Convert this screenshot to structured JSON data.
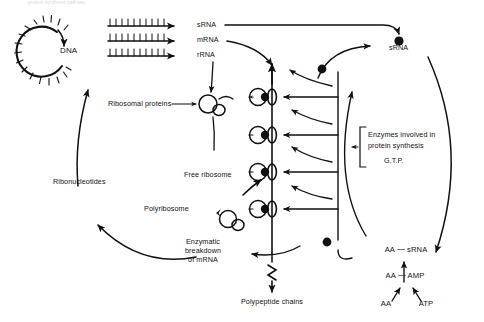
{
  "figure": {
    "caption": "protein synthesis pathway",
    "domain": "molecular-biology-diagram"
  },
  "labels": {
    "dna": "DNA",
    "srna_transcript": "sRNA",
    "mrna_transcript": "mRNA",
    "rrna_transcript": "rRNA",
    "srna_pool": "sRNA",
    "ribosomal_proteins": "Ribosomal proteins",
    "free_ribosome": "Free ribosome",
    "polyribosome": "Polyribosome",
    "ribonucleotides": "Ribonucleotides",
    "enzymatic_breakdown": "Enzymatic\nbreakdown\nof mRNA",
    "enzymatic_breakdown_line1": "Enzymatic",
    "enzymatic_breakdown_line2": "breakdown",
    "enzymatic_breakdown_line3": "of mRNA",
    "polypeptide_chains": "Polypeptide chains",
    "enzymes_line1": "Enzymes involved in",
    "enzymes_line2": "protein synthesis",
    "gtp": "G.T.P.",
    "aa_srna": "AA ⁓ sRNA",
    "aa_amp": "AA ⁓ AMP",
    "aa": "AA",
    "atp": "ATP"
  },
  "colors": {
    "ink": "#111111",
    "background": "#ffffff"
  },
  "structures": {
    "transcript_count": 3,
    "ribosome_count": 4,
    "dna_spike_count": 22
  }
}
